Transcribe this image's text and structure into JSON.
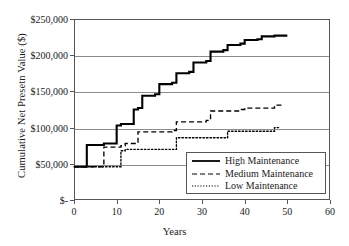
{
  "chart_data": {
    "type": "line",
    "title": "",
    "subtitle": "",
    "xlabel": "Years",
    "ylabel": "Cumulative Net Presetn Value ($)",
    "xlim": [
      0,
      60
    ],
    "ylim": [
      0,
      250000
    ],
    "xticks": [
      "0",
      "10",
      "20",
      "30",
      "40",
      "50",
      "60"
    ],
    "xtick_values": [
      0,
      10,
      20,
      30,
      40,
      50,
      60
    ],
    "yticks": [
      "$-",
      "$50,000",
      "$100,000",
      "$150,000",
      "$200,000",
      "$250,000"
    ],
    "ytick_values": [
      0,
      50000,
      100000,
      150000,
      200000,
      250000
    ],
    "grid": "horizontal",
    "legend_position": "lower-right",
    "step_shape": "staircase",
    "series": [
      {
        "name": "High Maintenance",
        "style": "solid",
        "color": "#000000",
        "x": [
          0,
          3,
          3,
          7,
          7,
          10,
          10,
          11,
          11,
          14,
          14,
          15,
          15,
          16,
          16,
          19,
          19,
          20,
          20,
          23,
          23,
          24,
          24,
          27,
          27,
          28,
          28,
          31,
          31,
          32,
          32,
          35,
          35,
          36,
          36,
          39,
          39,
          40,
          40,
          43,
          43,
          44,
          44,
          47,
          47,
          48,
          48,
          50
        ],
        "y": [
          46000,
          46000,
          76000,
          76000,
          78000,
          78000,
          103000,
          103000,
          105000,
          105000,
          125000,
          125000,
          127000,
          127000,
          144000,
          144000,
          146000,
          146000,
          160000,
          160000,
          162000,
          162000,
          175000,
          175000,
          177000,
          177000,
          190000,
          190000,
          192000,
          192000,
          205000,
          205000,
          207000,
          207000,
          214000,
          214000,
          216000,
          216000,
          221000,
          221000,
          222000,
          222000,
          226000,
          226000,
          227000,
          227000,
          227000,
          227000
        ]
      },
      {
        "name": "Medium Maintenance",
        "style": "dashed",
        "color": "#000000",
        "x": [
          0,
          7,
          7,
          11,
          11,
          12,
          12,
          15,
          15,
          23,
          23,
          24,
          24,
          31,
          31,
          32,
          32,
          39,
          39,
          40,
          40,
          47,
          47,
          49
        ],
        "y": [
          46000,
          46000,
          73000,
          73000,
          75000,
          75000,
          78000,
          78000,
          94000,
          94000,
          96000,
          96000,
          108000,
          108000,
          110000,
          110000,
          123000,
          123000,
          125000,
          125000,
          127000,
          127000,
          131000,
          131000
        ]
      },
      {
        "name": "Low Maintenance",
        "style": "dotted",
        "color": "#000000",
        "x": [
          0,
          11,
          11,
          12,
          12,
          23,
          23,
          24,
          24,
          35,
          35,
          36,
          36,
          47,
          47,
          48
        ],
        "y": [
          46000,
          46000,
          68000,
          68000,
          70000,
          70000,
          70000,
          70000,
          86000,
          86000,
          86000,
          86000,
          95000,
          95000,
          100000,
          100000
        ]
      }
    ],
    "legend": [
      {
        "label": "High Maintenance",
        "style": "solid"
      },
      {
        "label": "Medium Maintenance",
        "style": "dashed"
      },
      {
        "label": "Low Maintenance",
        "style": "dotted"
      }
    ]
  }
}
